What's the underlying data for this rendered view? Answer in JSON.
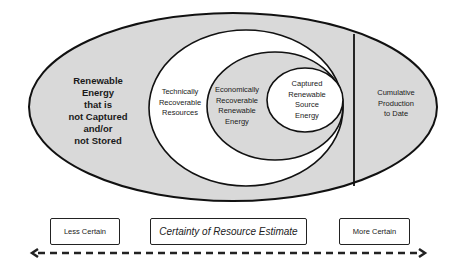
{
  "diagram": {
    "regions": {
      "outer": {
        "label": "Renewable\nEnergy\nthat is\nnot Captured\nand/or\nnot Stored",
        "fill": "#d9d9d9"
      },
      "technical": {
        "label": "Technically\nRecoverable\nResources",
        "fill": "#ffffff"
      },
      "economic": {
        "label": "Economically\nRecoverable\nRenewable\nEnergy",
        "fill": "#d9d9d9"
      },
      "captured": {
        "label": "Captured\nRenewable\nSource\nEnergy",
        "fill": "#ffffff"
      },
      "cumulative": {
        "label": "Cumulative\nProduction\nto Date",
        "fill": "#d9d9d9"
      }
    },
    "scale": {
      "left_label": "Less Certain",
      "center_label": "Certainty of Resource Estimate",
      "right_label": "More Certain"
    },
    "colors": {
      "stroke": "#111111",
      "gray_fill": "#d9d9d9"
    }
  }
}
